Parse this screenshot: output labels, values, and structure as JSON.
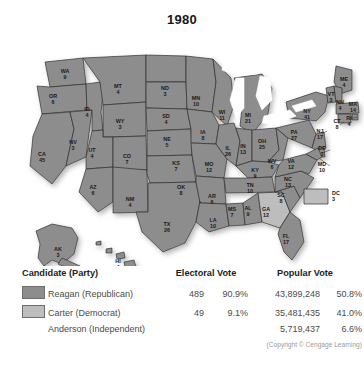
{
  "title": "1980",
  "map": {
    "dc_box": {
      "abbr": "DC",
      "votes": "3",
      "winner": "carter"
    },
    "states": [
      {
        "abbr": "WA",
        "votes": "9",
        "winner": "reagan",
        "x": 65,
        "y": 47
      },
      {
        "abbr": "OR",
        "votes": "6",
        "winner": "reagan",
        "x": 53,
        "y": 72
      },
      {
        "abbr": "CA",
        "votes": "45",
        "winner": "reagan",
        "x": 42,
        "y": 130
      },
      {
        "abbr": "NV",
        "votes": "3",
        "winner": "reagan",
        "x": 73,
        "y": 118
      },
      {
        "abbr": "ID",
        "votes": "4",
        "winner": "reagan",
        "x": 87,
        "y": 85
      },
      {
        "abbr": "MT",
        "votes": "4",
        "winner": "reagan",
        "x": 118,
        "y": 62
      },
      {
        "abbr": "WY",
        "votes": "3",
        "winner": "reagan",
        "x": 120,
        "y": 97
      },
      {
        "abbr": "UT",
        "votes": "4",
        "winner": "reagan",
        "x": 92,
        "y": 126
      },
      {
        "abbr": "CO",
        "votes": "7",
        "winner": "reagan",
        "x": 127,
        "y": 132
      },
      {
        "abbr": "AZ",
        "votes": "6",
        "winner": "reagan",
        "x": 93,
        "y": 163
      },
      {
        "abbr": "NM",
        "votes": "4",
        "winner": "reagan",
        "x": 130,
        "y": 175
      },
      {
        "abbr": "ND",
        "votes": "3",
        "winner": "reagan",
        "x": 165,
        "y": 64
      },
      {
        "abbr": "SD",
        "votes": "4",
        "winner": "reagan",
        "x": 166,
        "y": 92
      },
      {
        "abbr": "NE",
        "votes": "5",
        "winner": "reagan",
        "x": 167,
        "y": 115
      },
      {
        "abbr": "KS",
        "votes": "7",
        "winner": "reagan",
        "x": 176,
        "y": 139
      },
      {
        "abbr": "OK",
        "votes": "8",
        "winner": "reagan",
        "x": 181,
        "y": 163
      },
      {
        "abbr": "TX",
        "votes": "26",
        "winner": "reagan",
        "x": 167,
        "y": 200
      },
      {
        "abbr": "MN",
        "votes": "10",
        "winner": "reagan",
        "x": 196,
        "y": 74
      },
      {
        "abbr": "IA",
        "votes": "8",
        "winner": "reagan",
        "x": 203,
        "y": 108
      },
      {
        "abbr": "MO",
        "votes": "12",
        "winner": "reagan",
        "x": 209,
        "y": 140
      },
      {
        "abbr": "AR",
        "votes": "6",
        "winner": "reagan",
        "x": 212,
        "y": 172
      },
      {
        "abbr": "LA",
        "votes": "10",
        "winner": "reagan",
        "x": 213,
        "y": 196
      },
      {
        "abbr": "WI",
        "votes": "11",
        "winner": "reagan",
        "x": 222,
        "y": 88
      },
      {
        "abbr": "IL",
        "votes": "26",
        "winner": "reagan",
        "x": 228,
        "y": 124
      },
      {
        "abbr": "MS",
        "votes": "7",
        "winner": "reagan",
        "x": 232,
        "y": 185
      },
      {
        "abbr": "MI",
        "votes": "21",
        "winner": "reagan",
        "x": 248,
        "y": 91
      },
      {
        "abbr": "IN",
        "votes": "13",
        "winner": "reagan",
        "x": 243,
        "y": 122
      },
      {
        "abbr": "KY",
        "votes": "9",
        "winner": "reagan",
        "x": 255,
        "y": 146
      },
      {
        "abbr": "TN",
        "votes": "10",
        "winner": "reagan",
        "x": 250,
        "y": 161
      },
      {
        "abbr": "AL",
        "votes": "9",
        "winner": "reagan",
        "x": 248,
        "y": 184
      },
      {
        "abbr": "OH",
        "votes": "25",
        "winner": "reagan",
        "x": 262,
        "y": 117
      },
      {
        "abbr": "WV",
        "votes": "6",
        "winner": "reagan",
        "x": 272,
        "y": 137
      },
      {
        "abbr": "GA",
        "votes": "12",
        "winner": "carter",
        "x": 266,
        "y": 185
      },
      {
        "abbr": "FL",
        "votes": "17",
        "winner": "reagan",
        "x": 286,
        "y": 212
      },
      {
        "abbr": "SC",
        "votes": "8",
        "winner": "reagan",
        "x": 281,
        "y": 171
      },
      {
        "abbr": "NC",
        "votes": "13",
        "winner": "reagan",
        "x": 288,
        "y": 155
      },
      {
        "abbr": "VA",
        "votes": "12",
        "winner": "reagan",
        "x": 291,
        "y": 137
      },
      {
        "abbr": "PA",
        "votes": "27",
        "winner": "reagan",
        "x": 294,
        "y": 108
      },
      {
        "abbr": "NY",
        "votes": "41",
        "winner": "reagan",
        "x": 307,
        "y": 87
      },
      {
        "abbr": "ME",
        "votes": "4",
        "winner": "reagan",
        "x": 344,
        "y": 55
      },
      {
        "abbr": "VT",
        "votes": "3",
        "winner": "reagan",
        "x": 331,
        "y": 70
      },
      {
        "abbr": "NH",
        "votes": "4",
        "winner": "reagan",
        "x": 340,
        "y": 78
      },
      {
        "abbr": "MA",
        "votes": "14",
        "winner": "reagan",
        "x": 353,
        "y": 80
      },
      {
        "abbr": "RI",
        "votes": "4",
        "winner": "reagan",
        "x": 349,
        "y": 94
      },
      {
        "abbr": "CT",
        "votes": "8",
        "winner": "reagan",
        "x": 337,
        "y": 97
      },
      {
        "abbr": "NJ",
        "votes": "17",
        "winner": "reagan",
        "x": 320,
        "y": 107
      },
      {
        "abbr": "DE",
        "votes": "3",
        "winner": "reagan",
        "x": 322,
        "y": 124
      },
      {
        "abbr": "MD",
        "votes": "10",
        "winner": "reagan",
        "x": 322,
        "y": 140
      },
      {
        "abbr": "AK",
        "votes": "3",
        "winner": "reagan",
        "x": 58,
        "y": 225
      },
      {
        "abbr": "HI",
        "votes": "4",
        "winner": "reagan",
        "x": 118,
        "y": 237
      }
    ]
  },
  "table": {
    "headers": {
      "candidate": "Candidate (Party)",
      "electoral": "Electoral Vote",
      "popular": "Popular Vote"
    },
    "rows": [
      {
        "swatch": "reagan",
        "name": "Reagan (Republican)",
        "electoral_votes": "489",
        "electoral_pct": "90.9%",
        "popular_votes": "43,899,248",
        "popular_pct": "50.8%"
      },
      {
        "swatch": "carter",
        "name": "Carter (Democrat)",
        "electoral_votes": "49",
        "electoral_pct": "9.1%",
        "popular_votes": "35,481,435",
        "popular_pct": "41.0%"
      },
      {
        "swatch": "none",
        "name": "Anderson (Independent)",
        "electoral_votes": "",
        "electoral_pct": "",
        "popular_votes": "5,719,437",
        "popular_pct": "6.6%"
      }
    ],
    "copyright": "(Copyright © Cengage Learning)"
  },
  "colors": {
    "reagan": "#8d8d8d",
    "carter": "#bdbdbd",
    "border": "#2f2f2f",
    "lake": "#ffffff"
  }
}
